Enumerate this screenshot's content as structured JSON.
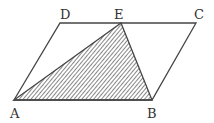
{
  "diagram": {
    "type": "parallelogram-with-shaded-triangle",
    "stroke_color": "#444444",
    "hatch_color": "#555555",
    "vertices": {
      "A": {
        "label": "A",
        "x": 14,
        "y": 100
      },
      "B": {
        "label": "B",
        "x": 152,
        "y": 100
      },
      "C": {
        "label": "C",
        "x": 196,
        "y": 23
      },
      "D": {
        "label": "D",
        "x": 60,
        "y": 23
      },
      "E": {
        "label": "E",
        "x": 121,
        "y": 23
      }
    },
    "parallelogram": [
      "A",
      "B",
      "C",
      "D"
    ],
    "shaded_triangle": [
      "A",
      "B",
      "E"
    ],
    "labels": {
      "A": "A",
      "B": "B",
      "C": "C",
      "D": "D",
      "E": "E"
    }
  }
}
